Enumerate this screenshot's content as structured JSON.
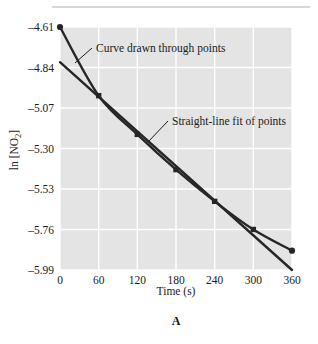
{
  "figure": {
    "panel_letter": "A",
    "background_color": "#ffffff",
    "plot_background_color": "#e4e4e4",
    "gridline_color": "#ffffff",
    "series_color": "#262626"
  },
  "chart_data": {
    "type": "line",
    "title": "",
    "subtitle": "",
    "xlabel": "Time (s)",
    "ylabel": "ln [NO2]",
    "ylabel_base": "ln [NO",
    "ylabel_sub": "2",
    "ylabel_close": "]",
    "xlim": [
      0,
      360
    ],
    "ylim": [
      -5.99,
      -4.61
    ],
    "grid": true,
    "legend": "none",
    "xticks": [
      0,
      60,
      120,
      180,
      240,
      300,
      360
    ],
    "xtick_labels": [
      "0",
      "60",
      "120",
      "180",
      "240",
      "300",
      "360"
    ],
    "yticks": [
      -4.61,
      -4.84,
      -5.07,
      -5.3,
      -5.53,
      -5.76,
      -5.99
    ],
    "ytick_labels": [
      "–4.61",
      "–4.84",
      "–5.07",
      "–5.30",
      "–5.53",
      "–5.76",
      "–5.99"
    ],
    "x": [
      0,
      60,
      120,
      180,
      240,
      300,
      360
    ],
    "series": [
      {
        "name": "Curve drawn through points",
        "style": "curve-with-markers",
        "marker": "square",
        "values": [
          -4.61,
          -5.0,
          -5.22,
          -5.42,
          -5.6,
          -5.76,
          -5.88
        ]
      },
      {
        "name": "Straight-line fit of points",
        "style": "straight-line",
        "marker": "none",
        "endpoints_x": [
          0,
          360
        ],
        "endpoints_y": [
          -4.81,
          -5.99
        ]
      }
    ],
    "annotations": [
      {
        "name": "curve-annotation",
        "text": "Curve drawn through points",
        "text_x": 96,
        "text_y": 52,
        "leader_from_x": 92,
        "leader_from_y": 48,
        "leader_to_x": 75,
        "leader_to_y": 63
      },
      {
        "name": "line-annotation",
        "text": "Straight-line fit of points",
        "text_x": 172,
        "text_y": 125,
        "leader_from_x": 168,
        "leader_from_y": 121,
        "leader_to_x": 148,
        "leader_to_y": 142
      }
    ]
  }
}
